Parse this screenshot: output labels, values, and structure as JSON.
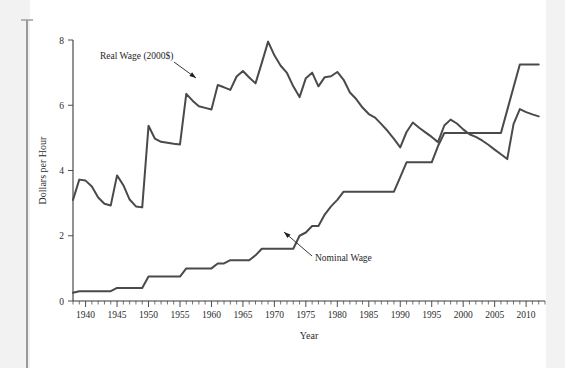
{
  "figure": {
    "name": "minimum-wage-chart"
  },
  "chart_data": {
    "type": "line",
    "title": "",
    "xlabel": "Year",
    "ylabel": "Dollars per Hour",
    "xlim": [
      1938,
      2013
    ],
    "ylim": [
      0,
      8
    ],
    "grid": false,
    "legend_position": "inline-annotations",
    "x_ticks_major": [
      1940,
      1945,
      1950,
      1955,
      1960,
      1965,
      1970,
      1975,
      1980,
      1985,
      1990,
      1995,
      2000,
      2005,
      2010
    ],
    "x_tick_labels": [
      "1940",
      "1945",
      "1950",
      "1955",
      "1960",
      "1965",
      "1970",
      "1975",
      "1980",
      "1985",
      "1990",
      "1995",
      "2000",
      "2005",
      "2010"
    ],
    "x_minor_tick_step": 1,
    "y_ticks": [
      0,
      2,
      4,
      6,
      8
    ],
    "y_tick_labels": [
      "0",
      "2",
      "4",
      "6",
      "8"
    ],
    "annotations": [
      {
        "text": "Real Wage (2000$)",
        "target_x": 1960,
        "target_y": 6.65
      },
      {
        "text": "Nominal Wage",
        "target_x": 1975,
        "target_y": 2.2
      }
    ],
    "series": [
      {
        "name": "Real Wage (2000$)",
        "color": "#4a4a4a",
        "x": [
          1938,
          1939,
          1940,
          1941,
          1942,
          1943,
          1944,
          1945,
          1946,
          1947,
          1948,
          1949,
          1950,
          1951,
          1952,
          1953,
          1954,
          1955,
          1956,
          1957,
          1958,
          1959,
          1960,
          1961,
          1962,
          1963,
          1964,
          1965,
          1966,
          1967,
          1968,
          1969,
          1970,
          1971,
          1972,
          1973,
          1974,
          1975,
          1976,
          1977,
          1978,
          1979,
          1980,
          1981,
          1982,
          1983,
          1984,
          1985,
          1986,
          1987,
          1988,
          1989,
          1990,
          1991,
          1992,
          1993,
          1994,
          1995,
          1996,
          1997,
          1998,
          1999,
          2000,
          2001,
          2002,
          2003,
          2004,
          2005,
          2006,
          2007,
          2008,
          2009,
          2010,
          2011,
          2012
        ],
        "values": [
          3.1,
          3.72,
          3.69,
          3.51,
          3.17,
          2.98,
          2.93,
          3.85,
          3.55,
          3.11,
          2.9,
          2.87,
          5.37,
          4.98,
          4.88,
          4.85,
          4.82,
          4.8,
          6.35,
          6.14,
          5.97,
          5.92,
          5.87,
          6.62,
          6.55,
          6.47,
          6.88,
          7.05,
          6.85,
          6.67,
          7.3,
          7.95,
          7.53,
          7.21,
          6.99,
          6.58,
          6.25,
          6.83,
          7.0,
          6.58,
          6.86,
          6.89,
          7.02,
          6.78,
          6.39,
          6.19,
          5.93,
          5.73,
          5.62,
          5.42,
          5.21,
          4.97,
          4.71,
          5.18,
          5.47,
          5.31,
          5.17,
          5.03,
          4.87,
          5.38,
          5.56,
          5.44,
          5.26,
          5.11,
          5.03,
          4.92,
          4.79,
          4.64,
          4.5,
          4.35,
          5.42,
          5.88,
          5.79,
          5.72,
          5.66
        ]
      },
      {
        "name": "Nominal Wage",
        "color": "#4a4a4a",
        "x": [
          1938,
          1939,
          1940,
          1941,
          1942,
          1943,
          1944,
          1945,
          1946,
          1947,
          1948,
          1949,
          1950,
          1951,
          1952,
          1953,
          1954,
          1955,
          1956,
          1957,
          1958,
          1959,
          1960,
          1961,
          1962,
          1963,
          1964,
          1965,
          1966,
          1967,
          1968,
          1969,
          1970,
          1971,
          1972,
          1973,
          1974,
          1975,
          1976,
          1977,
          1978,
          1979,
          1980,
          1981,
          1982,
          1983,
          1984,
          1985,
          1986,
          1987,
          1988,
          1989,
          1990,
          1991,
          1992,
          1993,
          1994,
          1995,
          1996,
          1997,
          1998,
          1999,
          2000,
          2001,
          2002,
          2003,
          2004,
          2005,
          2006,
          2007,
          2008,
          2009,
          2010,
          2011,
          2012
        ],
        "values": [
          0.25,
          0.3,
          0.3,
          0.3,
          0.3,
          0.3,
          0.3,
          0.4,
          0.4,
          0.4,
          0.4,
          0.4,
          0.75,
          0.75,
          0.75,
          0.75,
          0.75,
          0.75,
          1.0,
          1.0,
          1.0,
          1.0,
          1.0,
          1.15,
          1.15,
          1.25,
          1.25,
          1.25,
          1.25,
          1.4,
          1.6,
          1.6,
          1.6,
          1.6,
          1.6,
          1.6,
          2.0,
          2.1,
          2.3,
          2.3,
          2.65,
          2.9,
          3.1,
          3.35,
          3.35,
          3.35,
          3.35,
          3.35,
          3.35,
          3.35,
          3.35,
          3.35,
          3.8,
          4.25,
          4.25,
          4.25,
          4.25,
          4.25,
          4.75,
          5.15,
          5.15,
          5.15,
          5.15,
          5.15,
          5.15,
          5.15,
          5.15,
          5.15,
          5.15,
          5.85,
          6.55,
          7.25,
          7.25,
          7.25,
          7.25
        ]
      }
    ]
  }
}
